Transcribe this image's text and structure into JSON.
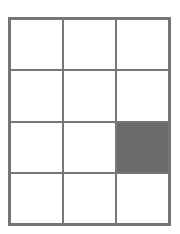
{
  "grid": {
    "rows": 4,
    "cols": 3,
    "line_color": "#757575",
    "fill_color": "#6b6b6b",
    "empty_color": "#ffffff",
    "cells": [
      [
        0,
        0,
        0
      ],
      [
        0,
        0,
        0
      ],
      [
        0,
        0,
        1
      ],
      [
        0,
        0,
        0
      ]
    ]
  }
}
